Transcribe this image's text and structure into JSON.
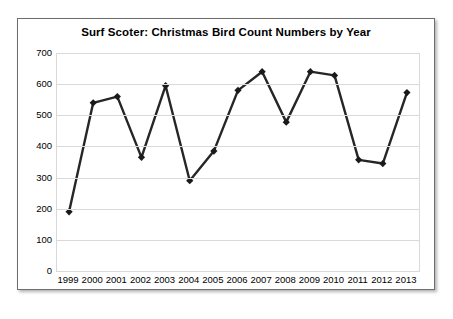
{
  "chart_data": {
    "type": "line",
    "title": "Surf Scoter: Christmas Bird Count Numbers by Year",
    "xlabel": "",
    "ylabel": "",
    "categories": [
      "1999",
      "2000",
      "2001",
      "2002",
      "2003",
      "2004",
      "2005",
      "2006",
      "2007",
      "2008",
      "2009",
      "2010",
      "2011",
      "2012",
      "2013"
    ],
    "values": [
      190,
      540,
      560,
      365,
      595,
      290,
      385,
      580,
      640,
      478,
      640,
      628,
      357,
      345,
      573
    ],
    "series": [
      {
        "name": "Surf Scoter",
        "values": [
          190,
          540,
          560,
          365,
          595,
          290,
          385,
          580,
          640,
          478,
          640,
          628,
          357,
          345,
          573
        ]
      }
    ],
    "ylim": [
      0,
      700
    ],
    "y_ticks": [
      0,
      100,
      200,
      300,
      400,
      500,
      600,
      700
    ],
    "grid": "horizontal",
    "legend": "none",
    "marker": "diamond",
    "line_color": "#262626",
    "marker_color": "#1a1a1a",
    "gridline_color": "#d9d9d9",
    "plot_border_color": "#d9d9d9",
    "frame_border_color": "#6e6e6e",
    "background_color": "#ffffff"
  }
}
